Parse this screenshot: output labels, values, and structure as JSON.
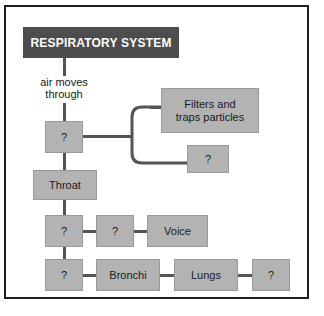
{
  "diagram": {
    "title": "RESPIRATORY SYSTEM",
    "flow_label": "air moves\nthrough",
    "colors": {
      "title_bar_bg": "#4d4d4d",
      "title_bar_text": "#ffffff",
      "node_bg": "#b3b3b3",
      "node_text": "#1a1a1a",
      "connector": "#555555",
      "frame_border": "#1d1d1d",
      "page_bg": "#ffffff"
    },
    "nodes": {
      "nose": "?",
      "filters": "Filters and\ntraps particles",
      "nose_branch_2": "?",
      "throat": "Throat",
      "windpipe": "?",
      "voicebox": "?",
      "voice": "Voice",
      "bottom_first": "?",
      "bronchi": "Bronchi",
      "lungs": "Lungs",
      "bottom_last": "?"
    }
  }
}
